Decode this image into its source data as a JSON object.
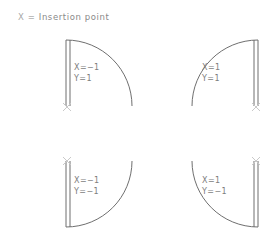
{
  "legend": {
    "symbol": "X",
    "text": "=  Insertion  point"
  },
  "colors": {
    "stroke": "#6f6f6f",
    "text": "#7d7d7d",
    "marker": "#c9c9c9",
    "background": "#ffffff"
  },
  "shapes": [
    {
      "id": "top-left",
      "name": "arc-quadrant-top-left",
      "x_label": "X=−1",
      "y_label": "Y=1",
      "straight_edge": "left",
      "insertion_marker": "bottom-left"
    },
    {
      "id": "top-right",
      "name": "arc-quadrant-top-right",
      "x_label": "X=1",
      "y_label": "Y=1",
      "straight_edge": "right",
      "insertion_marker": "bottom-right"
    },
    {
      "id": "bottom-left",
      "name": "arc-quadrant-bottom-left",
      "x_label": "X=−1",
      "y_label": "Y=−1",
      "straight_edge": "left",
      "insertion_marker": "top-left"
    },
    {
      "id": "bottom-right",
      "name": "arc-quadrant-bottom-right",
      "x_label": "X=1",
      "y_label": "Y=−1",
      "straight_edge": "right",
      "insertion_marker": "top-right"
    }
  ]
}
